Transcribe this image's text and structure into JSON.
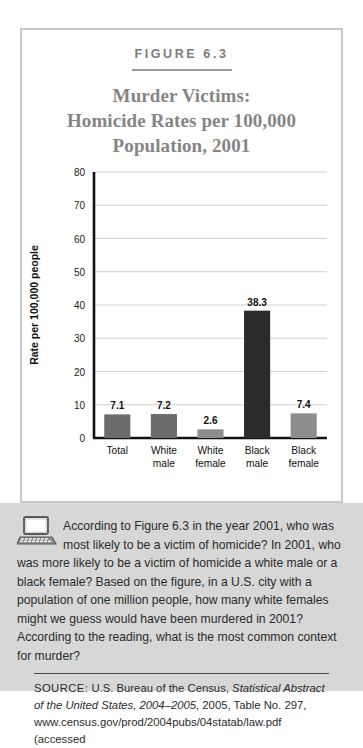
{
  "figure": {
    "label": "FIGURE 6.3",
    "title_lines": [
      "Murder Victims:",
      "Homicide Rates per 100,000",
      "Population, 2001"
    ]
  },
  "chart_data": {
    "type": "bar",
    "title": "Murder Victims: Homicide Rates per 100,000 Population, 2001",
    "categories": [
      "Total",
      "White male",
      "White female",
      "Black male",
      "Black female"
    ],
    "category_lines": [
      [
        "Total",
        ""
      ],
      [
        "White",
        "male"
      ],
      [
        "White",
        "female"
      ],
      [
        "Black",
        "male"
      ],
      [
        "Black",
        "female"
      ]
    ],
    "values": [
      7.1,
      7.2,
      2.6,
      38.3,
      7.4
    ],
    "value_labels": [
      "7.1",
      "7.2",
      "2.6",
      "38.3",
      "7.4"
    ],
    "bar_colors": [
      "#6b6b6b",
      "#6b6b6b",
      "#8d8d8d",
      "#2b2b2b",
      "#8d8d8d"
    ],
    "xlabel": "",
    "ylabel": "Rate per 100,000 people",
    "ylim": [
      0,
      80
    ],
    "yticks": [
      0,
      10,
      20,
      30,
      40,
      50,
      60,
      70,
      80
    ],
    "ytick_labels": [
      "0",
      "10",
      "20",
      "30",
      "40",
      "50",
      "60",
      "70",
      "80"
    ],
    "grid": true,
    "legend": "none"
  },
  "question": {
    "icon": "computer-icon",
    "text": "According to Figure 6.3 in the year 2001, who was most likely to be a victim of homicide? In 2001, who was more likely to be a victim of homicide a white male or a black female? Based on the figure, in a U.S. city with a population of one million people, how many white females might we guess would have been murdered in 2001? According to the reading, what is the most common context for murder?"
  },
  "source": {
    "label": "SOURCE:",
    "part1": " U.S. Bureau of the Census, ",
    "italic1": "Statistical Abstract of the United States, 2004–2005",
    "part2": ", 2005, Table No. 297, www.census.gov/prod/2004pubs/04statab/law.pdf (accessed"
  },
  "colors": {
    "frame_border": "#c9c9c9",
    "title_gray": "#858585",
    "panel_bg": "#d7d7d7",
    "axis": "#111111",
    "gridline": "#d0d0d0"
  }
}
